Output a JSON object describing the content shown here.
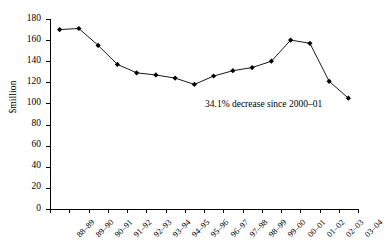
{
  "chart_data": {
    "type": "line",
    "title": "",
    "xlabel": "",
    "ylabel": "$million",
    "ylim": [
      0,
      180
    ],
    "ytick_step": 20,
    "yticks": [
      0,
      20,
      40,
      60,
      80,
      100,
      120,
      140,
      160,
      180
    ],
    "grid": false,
    "legend": null,
    "marker": "diamond",
    "line_color": "#000000",
    "marker_color": "#000000",
    "categories": [
      "88–89",
      "89–90",
      "90–91",
      "91–92",
      "92–93",
      "93–94",
      "94–95",
      "95–96",
      "96–97",
      "97–98",
      "98–99",
      "99–00",
      "00–01",
      "01–02",
      "02–03",
      "03–04"
    ],
    "values": [
      170,
      171,
      155,
      137,
      129,
      127,
      124,
      118,
      126,
      131,
      134,
      140,
      160,
      157,
      121,
      105
    ],
    "annotations": [
      {
        "text": "34.1% decrease since 2000–01",
        "x_category": "96–97",
        "y_value": 85
      }
    ]
  }
}
